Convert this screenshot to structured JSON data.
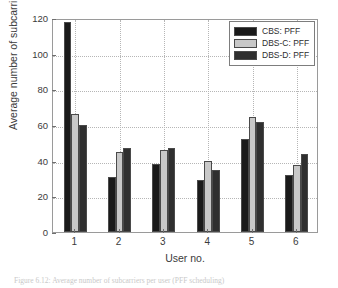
{
  "chart_data": {
    "type": "bar",
    "title": "",
    "subtitle": "",
    "xlabel": "User no.",
    "ylabel": "Average number of subcarriers",
    "categories": [
      "1",
      "2",
      "3",
      "4",
      "5",
      "6"
    ],
    "series": [
      {
        "name": "CBS: PFF",
        "color": "#1a1a1a",
        "values": [
          118,
          31,
          38,
          29,
          52,
          32
        ]
      },
      {
        "name": "DBS-C: PFF",
        "color": "#c8c8c8",
        "values": [
          66,
          45,
          46,
          40,
          64.5,
          37.5
        ]
      },
      {
        "name": "DBS-D: PFF",
        "color": "#2f2f2f",
        "values": [
          60,
          47,
          47,
          35,
          61.5,
          44
        ]
      }
    ],
    "ylim": [
      0,
      120
    ],
    "yticks": [
      0,
      20,
      40,
      60,
      80,
      100,
      120
    ],
    "ytick_labels": [
      "0",
      "20",
      "40",
      "60",
      "80",
      "100",
      "120"
    ],
    "xticks": [
      1,
      2,
      3,
      4,
      5,
      6
    ],
    "grid": true,
    "grid_style": "dotted",
    "legend_position": "top-right",
    "legend_entries": [
      "CBS: PFF",
      "DBS-C: PFF",
      "DBS-D: PFF"
    ]
  },
  "caption": {
    "text": "Figure 6.12: Average number of subcarriers per user (PFF scheduling)"
  }
}
